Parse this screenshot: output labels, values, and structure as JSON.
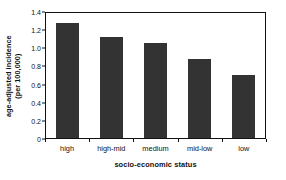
{
  "chart_data": {
    "type": "bar",
    "title": "",
    "subtitle": "",
    "categories": [
      "high",
      "high-mid",
      "medium",
      "mid-low",
      "low"
    ],
    "values": [
      1.27,
      1.11,
      1.05,
      0.87,
      0.69
    ],
    "series": [
      {
        "name": "age-adjusted incidence",
        "values": [
          1.27,
          1.11,
          1.05,
          0.87,
          0.69
        ]
      }
    ],
    "xlabel": "socio-economic status",
    "ylabel_line1": "age-adjusted incidence",
    "ylabel_line2": "(per 100,000)",
    "ylabel": "age-adjusted incidence (per 100,000)",
    "ylim": [
      0,
      1.4
    ],
    "ytick_labels": [
      "0",
      "0.2",
      "0.4",
      "0.6",
      "0.8",
      "1.0",
      "1.2",
      "1.4"
    ],
    "ytick_values": [
      0,
      0.2,
      0.4,
      0.6,
      0.8,
      1.0,
      1.2,
      1.4
    ],
    "grid": false,
    "legend": false,
    "legend_position": "none",
    "bar_color": "#333333",
    "axis_color": "#111111",
    "background_color": "#ffffff"
  }
}
